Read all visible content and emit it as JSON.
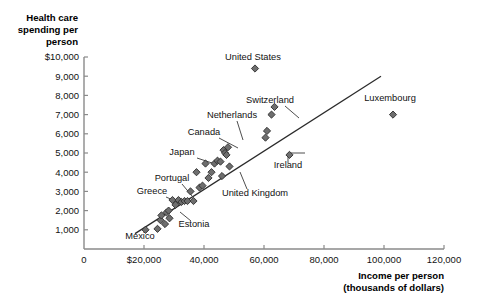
{
  "chart_data": {
    "type": "scatter",
    "title": "",
    "ylabel_lines": [
      "Health care",
      "spending per",
      "person"
    ],
    "xlabel_lines": [
      "Income per person",
      "(thousands of dollars)"
    ],
    "xlabel": "Income per person (thousands of dollars)",
    "ylabel": "Health care spending per person",
    "xlim": [
      0,
      122000
    ],
    "ylim": [
      0,
      10200
    ],
    "grid": false,
    "legend": "none",
    "x_ticks": [
      {
        "value": 0,
        "label": "0"
      },
      {
        "value": 20000,
        "label": "$20,000"
      },
      {
        "value": 40000,
        "label": "40,000"
      },
      {
        "value": 60000,
        "label": "60,000"
      },
      {
        "value": 80000,
        "label": "80,000"
      },
      {
        "value": 100000,
        "label": "100,000"
      },
      {
        "value": 120000,
        "label": "120,000"
      }
    ],
    "y_ticks": [
      {
        "value": 1000,
        "label": "1,000"
      },
      {
        "value": 2000,
        "label": "2,000"
      },
      {
        "value": 3000,
        "label": "3,000"
      },
      {
        "value": 4000,
        "label": "4,000"
      },
      {
        "value": 5000,
        "label": "5,000"
      },
      {
        "value": 6000,
        "label": "6,000"
      },
      {
        "value": 7000,
        "label": "7,000"
      },
      {
        "value": 8000,
        "label": "8,000"
      },
      {
        "value": 9000,
        "label": "9,000"
      },
      {
        "value": 10000,
        "label": "$10,000"
      }
    ],
    "trend_line": {
      "x_start": 17000,
      "y_start": 800,
      "x_end": 99000,
      "y_end": 9000
    },
    "points": [
      {
        "x": 20500,
        "y": 1000
      },
      {
        "x": 24500,
        "y": 1050
      },
      {
        "x": 25500,
        "y": 1500
      },
      {
        "x": 25800,
        "y": 1750
      },
      {
        "x": 27000,
        "y": 1300
      },
      {
        "x": 27500,
        "y": 1900
      },
      {
        "x": 28200,
        "y": 2000
      },
      {
        "x": 28500,
        "y": 1600
      },
      {
        "x": 29500,
        "y": 2550
      },
      {
        "x": 30500,
        "y": 2300
      },
      {
        "x": 31500,
        "y": 2550
      },
      {
        "x": 32500,
        "y": 2450
      },
      {
        "x": 33500,
        "y": 2500
      },
      {
        "x": 34500,
        "y": 2500
      },
      {
        "x": 35500,
        "y": 3000
      },
      {
        "x": 36500,
        "y": 2500
      },
      {
        "x": 37500,
        "y": 4000
      },
      {
        "x": 38500,
        "y": 3200
      },
      {
        "x": 39500,
        "y": 3300
      },
      {
        "x": 40500,
        "y": 4450
      },
      {
        "x": 41500,
        "y": 3700
      },
      {
        "x": 42500,
        "y": 4000
      },
      {
        "x": 43500,
        "y": 4450
      },
      {
        "x": 44500,
        "y": 4600
      },
      {
        "x": 45500,
        "y": 4550
      },
      {
        "x": 46000,
        "y": 3800
      },
      {
        "x": 46500,
        "y": 5150
      },
      {
        "x": 47000,
        "y": 5000
      },
      {
        "x": 47500,
        "y": 4900
      },
      {
        "x": 48000,
        "y": 5300
      },
      {
        "x": 48500,
        "y": 4300
      },
      {
        "x": 57000,
        "y": 9400
      },
      {
        "x": 60500,
        "y": 5800
      },
      {
        "x": 61000,
        "y": 6150
      },
      {
        "x": 62500,
        "y": 7000
      },
      {
        "x": 63500,
        "y": 7400
      },
      {
        "x": 68500,
        "y": 4900
      },
      {
        "x": 103000,
        "y": 7000
      }
    ],
    "annotations": [
      {
        "label": "United States",
        "lx": 253,
        "ly": 60,
        "anchor": "middle",
        "leader": null
      },
      {
        "label": "Switzerland",
        "lx": 270,
        "ly": 103,
        "anchor": "middle",
        "leader": [
          [
            285,
            106
          ],
          [
            299,
            118
          ]
        ]
      },
      {
        "label": "Luxembourg",
        "lx": 390,
        "ly": 101,
        "anchor": "middle",
        "leader": null
      },
      {
        "label": "Netherlands",
        "lx": 232,
        "ly": 118,
        "anchor": "middle",
        "leader": [
          [
            237,
            121
          ],
          [
            243,
            140
          ]
        ]
      },
      {
        "label": "Canada",
        "lx": 204,
        "ly": 135,
        "anchor": "middle",
        "leader": [
          [
            219,
            138
          ],
          [
            238,
            148
          ]
        ]
      },
      {
        "label": "Japan",
        "lx": 182,
        "ly": 155,
        "anchor": "middle",
        "leader": [
          [
            197,
            158
          ],
          [
            215,
            164
          ]
        ]
      },
      {
        "label": "Ireland",
        "lx": 288,
        "ly": 168,
        "anchor": "middle",
        "leader": [
          [
            288,
            163
          ],
          [
            288,
            153
          ],
          [
            305,
            153
          ]
        ]
      },
      {
        "label": "Portugal",
        "lx": 172,
        "ly": 181,
        "anchor": "middle",
        "leader": [
          [
            182,
            184
          ],
          [
            192,
            196
          ]
        ]
      },
      {
        "label": "United Kingdom",
        "lx": 255,
        "ly": 196,
        "anchor": "middle",
        "leader": [
          [
            247,
            189
          ],
          [
            240,
            172
          ]
        ]
      },
      {
        "label": "Greece",
        "lx": 152,
        "ly": 194,
        "anchor": "middle",
        "leader": [
          [
            166,
            197
          ],
          [
            180,
            203
          ]
        ]
      },
      {
        "label": "Estonia",
        "lx": 194,
        "ly": 227,
        "anchor": "middle",
        "leader": [
          [
            191,
            221
          ],
          [
            180,
            212
          ]
        ]
      },
      {
        "label": "Mexico",
        "lx": 140,
        "ly": 239,
        "anchor": "middle",
        "leader": null
      }
    ]
  }
}
